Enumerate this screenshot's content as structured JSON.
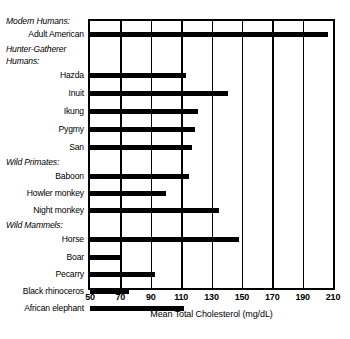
{
  "chart_data": {
    "type": "bar",
    "orientation": "horizontal",
    "title": "",
    "xlabel": "Mean Total Cholesterol (mg/dL)",
    "ylabel": "",
    "xlim": [
      50,
      210
    ],
    "xticks": [
      50,
      70,
      90,
      110,
      130,
      150,
      170,
      190,
      210
    ],
    "grid": true,
    "grid_axis": "x",
    "legend": false,
    "bar_color": "#000000",
    "background": "#ffffff",
    "categories": [
      "Adult American",
      "Hazda",
      "Inuit",
      "Ikung",
      "Pygmy",
      "San",
      "Baboon",
      "Howler monkey",
      "Night monkey",
      "Horse",
      "Boar",
      "Pecarry",
      "Black rhinoceros",
      "African elephant"
    ],
    "values": [
      207,
      113,
      141,
      121,
      119,
      117,
      115,
      100,
      135,
      148,
      70,
      93,
      76,
      112
    ],
    "groups": [
      {
        "label": "Modern Humans:",
        "categories": [
          "Adult American"
        ]
      },
      {
        "label": "Hunter-Gatherer Humans:",
        "categories": [
          "Hazda",
          "Inuit",
          "Ikung",
          "Pygmy",
          "San"
        ]
      },
      {
        "label": "Wild Primates:",
        "categories": [
          "Baboon",
          "Howler monkey",
          "Night monkey"
        ]
      },
      {
        "label": "Wild Mammels:",
        "categories": [
          "Horse",
          "Boar",
          "Pecarry",
          "Black rhinoceros",
          "African elephant"
        ]
      }
    ]
  },
  "rows": [
    {
      "kind": "group",
      "text": "Modern Humans:",
      "y": 0
    },
    {
      "kind": "bar",
      "text": "Adult American",
      "y": 13,
      "value": 207
    },
    {
      "kind": "group",
      "text": "Hunter-Gatherer",
      "y": 28
    },
    {
      "kind": "group",
      "text": "Humans:",
      "y": 40
    },
    {
      "kind": "bar",
      "text": "Hazda",
      "y": 54,
      "value": 113
    },
    {
      "kind": "bar",
      "text": "Inuit",
      "y": 72,
      "value": 141
    },
    {
      "kind": "bar",
      "text": "Ikung",
      "y": 90,
      "value": 121
    },
    {
      "kind": "bar",
      "text": "Pygmy",
      "y": 108,
      "value": 119
    },
    {
      "kind": "bar",
      "text": "San",
      "y": 126,
      "value": 117
    },
    {
      "kind": "group",
      "text": "Wild Primates:",
      "y": 141
    },
    {
      "kind": "bar",
      "text": "Baboon",
      "y": 155,
      "value": 115
    },
    {
      "kind": "bar",
      "text": "Howler monkey",
      "y": 172,
      "value": 100
    },
    {
      "kind": "bar",
      "text": "Night monkey",
      "y": 189,
      "value": 135
    },
    {
      "kind": "group",
      "text": "Wild Mammels:",
      "y": 204
    },
    {
      "kind": "bar",
      "text": "Horse",
      "y": 218,
      "value": 148
    },
    {
      "kind": "bar",
      "text": "Boar",
      "y": 236,
      "value": 70
    },
    {
      "kind": "bar",
      "text": "Pecarry",
      "y": 253,
      "value": 93
    },
    {
      "kind": "bar",
      "text": "Black rhinoceros",
      "y": 270,
      "value": 76
    },
    {
      "kind": "bar",
      "text": "African elephant",
      "y": 287,
      "value": 112
    }
  ]
}
